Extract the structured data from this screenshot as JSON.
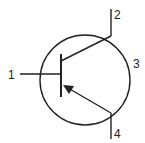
{
  "diagram": {
    "terminals": [
      {
        "id": "1",
        "label": "1",
        "role": "base"
      },
      {
        "id": "2",
        "label": "2",
        "role": "collector"
      },
      {
        "id": "3",
        "label": "3",
        "role": "case"
      },
      {
        "id": "4",
        "label": "4",
        "role": "emitter"
      }
    ],
    "colors": {
      "stroke": "#222222",
      "background": "#ffffff"
    }
  }
}
